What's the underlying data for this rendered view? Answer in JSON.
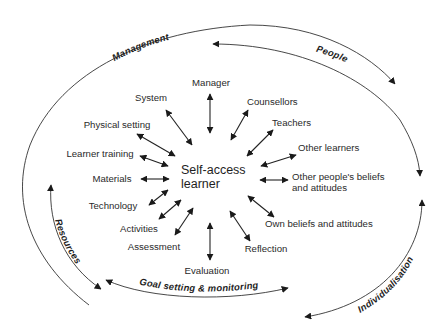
{
  "diagram": {
    "center": {
      "line1": "Self-access",
      "line2": "learner"
    },
    "spokes": [
      {
        "id": "manager",
        "label": "Manager"
      },
      {
        "id": "system",
        "label": "System"
      },
      {
        "id": "physical-setting",
        "label": "Physical setting"
      },
      {
        "id": "learner-training",
        "label": "Learner training"
      },
      {
        "id": "materials",
        "label": "Materials"
      },
      {
        "id": "technology",
        "label": "Technology"
      },
      {
        "id": "activities",
        "label": "Activities"
      },
      {
        "id": "assessment",
        "label": "Assessment"
      },
      {
        "id": "evaluation",
        "label": "Evaluation"
      },
      {
        "id": "reflection",
        "label": "Reflection"
      },
      {
        "id": "own-beliefs",
        "label": "Own beliefs and attitudes"
      },
      {
        "id": "other-peoples-beliefs",
        "label_line1": "Other people's beliefs",
        "label_line2": "and attitudes"
      },
      {
        "id": "other-learners",
        "label": "Other learners"
      },
      {
        "id": "teachers",
        "label": "Teachers"
      },
      {
        "id": "counsellors",
        "label": "Counsellors"
      }
    ],
    "outer_arcs": [
      {
        "id": "management",
        "label": "Management"
      },
      {
        "id": "people",
        "label": "People"
      },
      {
        "id": "individualisation",
        "label": "Individualisation"
      },
      {
        "id": "goal-setting",
        "label": "Goal setting & monitoring"
      },
      {
        "id": "resources",
        "label": "Resources"
      }
    ],
    "colors": {
      "line": "#222222",
      "text": "#2a2a2a",
      "background": "#ffffff"
    }
  }
}
